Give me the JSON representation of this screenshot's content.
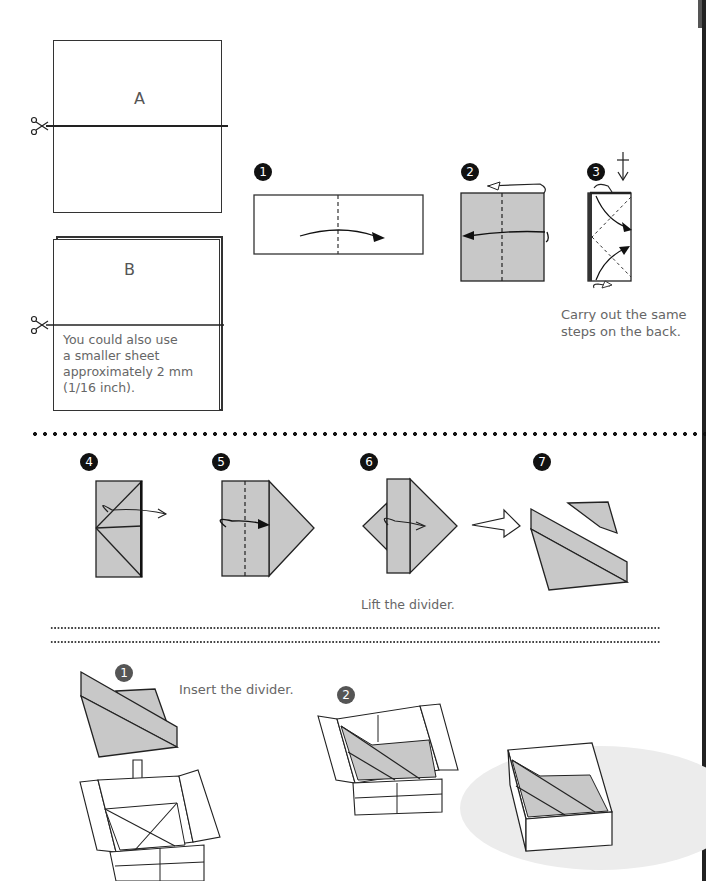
{
  "page": {
    "background": "#ffffff",
    "paper_fill": "#c8c8c8",
    "line_color": "#222222"
  },
  "intro": {
    "sheet_a": {
      "label": "A",
      "icon": "scissors-icon"
    },
    "sheet_b": {
      "label": "B",
      "icon": "scissors-icon",
      "note": [
        "You could also use",
        "a smaller sheet",
        "approximately 2 mm",
        "(1/16 inch)."
      ]
    }
  },
  "divider_steps": [
    {
      "number": "1",
      "description": "valley fold in half"
    },
    {
      "number": "2",
      "description": "fold sides to center, both sides"
    },
    {
      "number": "3",
      "description": "fold corners",
      "note": [
        "Carry out the same",
        "steps on the back."
      ]
    },
    {
      "number": "4"
    },
    {
      "number": "5"
    },
    {
      "number": "6"
    },
    {
      "number": "7"
    }
  ],
  "lift_note": "Lift the divider.",
  "assembly_steps": [
    {
      "number": "1",
      "note": "Insert the divider."
    },
    {
      "number": "2"
    }
  ]
}
